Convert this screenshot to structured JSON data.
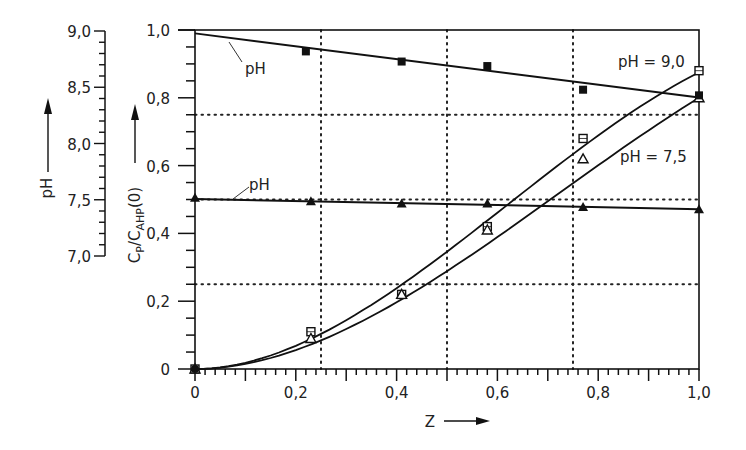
{
  "chart_data": {
    "type": "scatter",
    "title": "",
    "xlabel": "Z",
    "ylabel": "C_P/C_AHP(0)",
    "ylabel_secondary": "pH",
    "xlim": [
      0,
      1.0
    ],
    "ylim": [
      0,
      1.0
    ],
    "ylim_secondary": [
      7.0,
      9.0
    ],
    "x_ticks": [
      "0",
      "0,2",
      "0,4",
      "0,6",
      "0,8",
      "1,0"
    ],
    "y_ticks": [
      "0",
      "0,2",
      "0,4",
      "0,6",
      "0,8",
      "1,0"
    ],
    "y_secondary_ticks": [
      "7,0",
      "7,5",
      "8,0",
      "8,5",
      "9,0"
    ],
    "grid": "dotted at 0.25, 0.5, 0.75 on both axes",
    "annotations": [
      "pH",
      "pH",
      "pH = 9,0",
      "pH = 7,5"
    ],
    "series": [
      {
        "name": "C_P/C_AHP(0) at pH = 9,0",
        "marker": "open-square",
        "axis": "primary",
        "x": [
          0,
          0.23,
          0.41,
          0.58,
          0.77,
          1.0
        ],
        "y": [
          0,
          0.11,
          0.22,
          0.42,
          0.68,
          0.88
        ],
        "fit": "sigmoid curve"
      },
      {
        "name": "C_P/C_AHP(0) at pH = 7,5",
        "marker": "open-triangle",
        "axis": "primary",
        "x": [
          0,
          0.23,
          0.41,
          0.58,
          0.77,
          1.0
        ],
        "y": [
          0,
          0.09,
          0.22,
          0.41,
          0.62,
          0.8
        ],
        "fit": "sigmoid curve"
      },
      {
        "name": "pH (starting pH 9,0)",
        "marker": "filled-square",
        "axis": "secondary",
        "x": [
          0.22,
          0.41,
          0.58,
          0.77,
          1.0
        ],
        "y": [
          8.81,
          8.72,
          8.68,
          8.47,
          8.42
        ],
        "fit": "line from 8.97 at Z=0 to 8.40 at Z=1"
      },
      {
        "name": "pH (starting pH 7,5)",
        "marker": "filled-triangle",
        "axis": "secondary",
        "x": [
          0,
          0.23,
          0.41,
          0.58,
          0.77,
          1.0
        ],
        "y": [
          7.51,
          7.48,
          7.46,
          7.46,
          7.43,
          7.41
        ],
        "fit": "line from 7.50 at Z=0 to 7.41 at Z=1"
      }
    ]
  },
  "labels": {
    "x_axis_title": "Z",
    "y_axis_title_main": "C",
    "y_axis_title_sub1": "P",
    "y_axis_title_slash": "/C",
    "y_axis_title_sub2": "AHP",
    "y_axis_title_tail": "(0)",
    "ph_axis_title": "pH",
    "annot_ph_top": "pH",
    "annot_ph_bottom": "pH",
    "annot_ph90": "pH = 9,0",
    "annot_ph75": "pH = 7,5"
  },
  "ticks": {
    "x": [
      "0",
      "0,2",
      "0,4",
      "0,6",
      "0,8",
      "1,0"
    ],
    "y": [
      "0",
      "0,2",
      "0,4",
      "0,6",
      "0,8",
      "1,0"
    ],
    "ph": [
      "7,0",
      "7,5",
      "8,0",
      "8,5",
      "9,0"
    ]
  }
}
